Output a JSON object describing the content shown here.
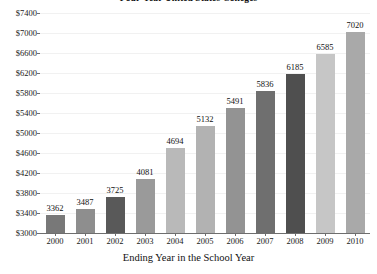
{
  "chart_data": {
    "type": "bar",
    "title": "Four-Year United States Colleges",
    "xlabel": "Ending Year in the School Year",
    "ylabel": "",
    "categories": [
      "2000",
      "2001",
      "2002",
      "2003",
      "2004",
      "2005",
      "2006",
      "2007",
      "2008",
      "2009",
      "2010"
    ],
    "values": [
      3362,
      3487,
      3725,
      4081,
      4694,
      5132,
      5491,
      5836,
      6185,
      6585,
      7020
    ],
    "value_labels": [
      "3362",
      "3487",
      "3725",
      "4081",
      "4694",
      "5132",
      "5491",
      "5836",
      "6185",
      "6585",
      "7020"
    ],
    "ylim": [
      3000,
      7400
    ],
    "ytick_step": 400,
    "ytick_labels": [
      "$7400",
      "$7000",
      "$6600",
      "$6200",
      "$5800",
      "$5400",
      "$5000",
      "$4600",
      "$4200",
      "$3800",
      "$3400",
      "$3000"
    ],
    "ytick_values": [
      7400,
      7000,
      6600,
      6200,
      5800,
      5400,
      5000,
      4600,
      4200,
      3800,
      3400,
      3000
    ],
    "bar_colors": [
      "#787878",
      "#8e8e8e",
      "#595959",
      "#9a9a9a",
      "#b9b9b9",
      "#b2b2b2",
      "#939393",
      "#6f6f6f",
      "#4f4f4f",
      "#c6c6c6",
      "#a9a9a9"
    ],
    "grid": true,
    "grid_color": "#f1f1f1",
    "axis_color": "#6e6e6e",
    "legend": null
  }
}
